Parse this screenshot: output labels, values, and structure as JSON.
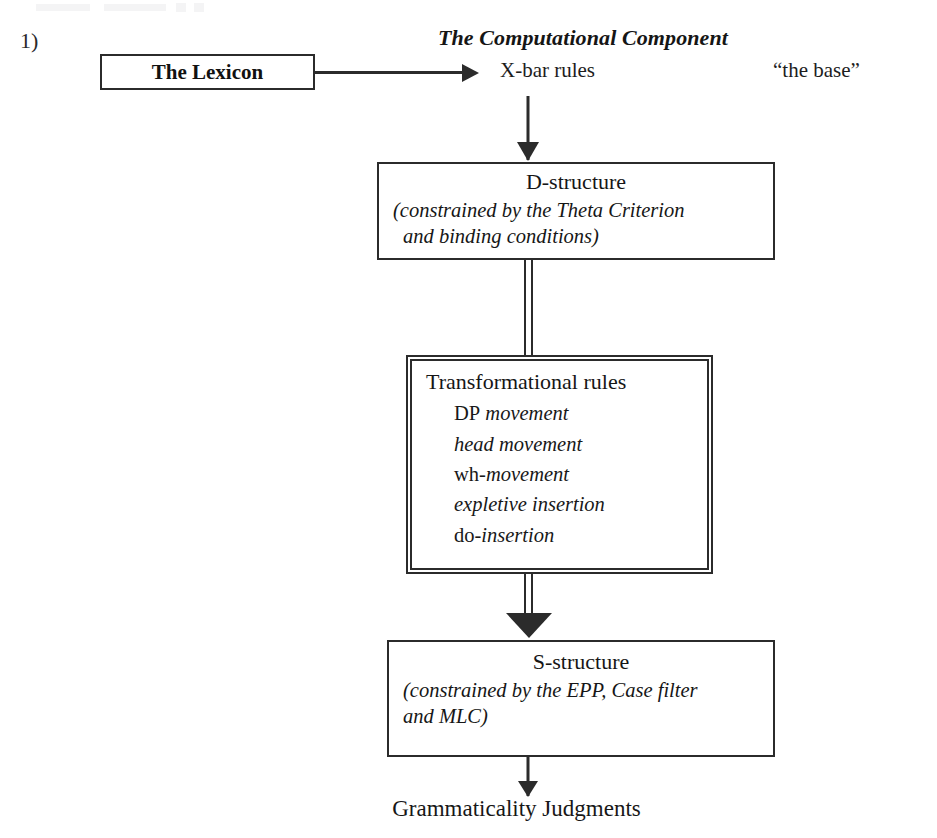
{
  "page": {
    "item_number": "1)",
    "section_title": "The Computational Component"
  },
  "lexicon": {
    "label": "The Lexicon"
  },
  "base": {
    "xbar_label": "X-bar rules",
    "annotation": "“the base”"
  },
  "stages": {
    "d_structure": {
      "headline": "D-structure",
      "note_line_1": "(constrained by the Theta Criterion",
      "note_line_2": "and binding conditions)"
    },
    "transformational": {
      "headline": "Transformational rules",
      "rules": [
        {
          "upright": "DP",
          "italic": " movement"
        },
        {
          "upright": "",
          "italic": "head movement"
        },
        {
          "upright": "wh-",
          "italic": "movement"
        },
        {
          "upright": "",
          "italic": "expletive insertion"
        },
        {
          "upright": "do",
          "italic": "-insertion"
        }
      ]
    },
    "s_structure": {
      "headline": "S-structure",
      "note_line_1": "(constrained by the EPP, Case filter",
      "note_line_2": "and MLC)"
    }
  },
  "output": {
    "label": "Grammaticality Judgments"
  },
  "colors": {
    "ink": "#2b2b2b",
    "text": "#161616",
    "paper": "#ffffff"
  }
}
